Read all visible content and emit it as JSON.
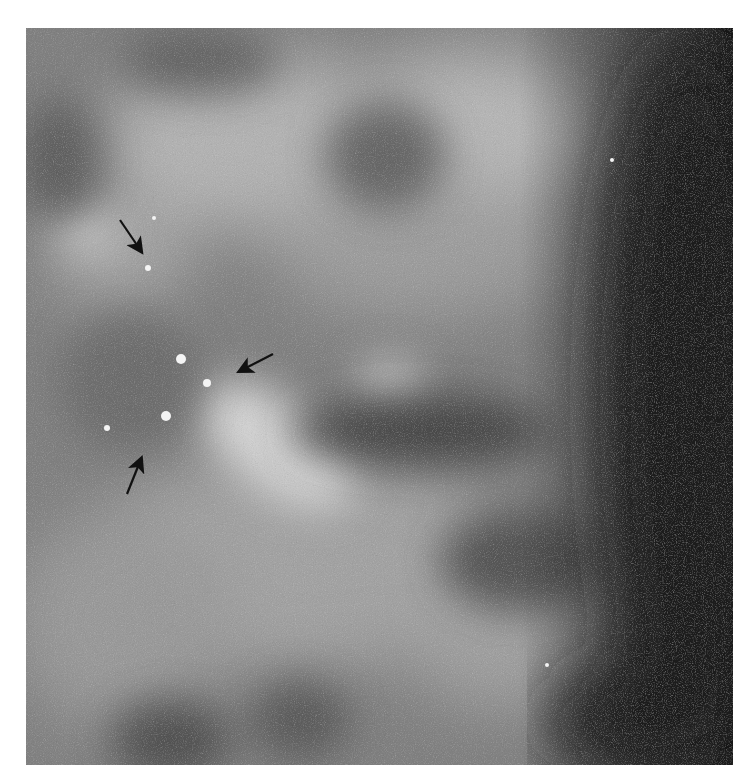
{
  "image": {
    "description": "Grayscale mammogram detail with clustered microcalcifications",
    "frame": {
      "x": 26,
      "y": 28,
      "width": 707,
      "height": 737
    },
    "colors": {
      "tissue_mid": "#7a7a7a",
      "tissue_light": "#c8c8c8",
      "tissue_dark": "#3a3a3a",
      "background_edge": "#1a1a1a",
      "calcification": "#f4f4f4",
      "arrow": "#111111"
    }
  },
  "annotations": {
    "arrows": [
      {
        "name": "arrow-upper",
        "tail": [
          120,
          220
        ],
        "head": [
          143,
          254
        ],
        "direction": "down-right"
      },
      {
        "name": "arrow-middle",
        "tail": [
          273,
          354
        ],
        "head": [
          237,
          373
        ],
        "direction": "down-left"
      },
      {
        "name": "arrow-lower",
        "tail": [
          127,
          494
        ],
        "head": [
          143,
          455
        ],
        "direction": "up-right"
      }
    ],
    "calcifications": [
      {
        "x": 148,
        "y": 268,
        "r": 3
      },
      {
        "x": 181,
        "y": 359,
        "r": 5
      },
      {
        "x": 207,
        "y": 383,
        "r": 4
      },
      {
        "x": 166,
        "y": 416,
        "r": 5
      },
      {
        "x": 107,
        "y": 428,
        "r": 3
      },
      {
        "x": 154,
        "y": 218,
        "r": 2
      },
      {
        "x": 612,
        "y": 160,
        "r": 2
      },
      {
        "x": 547,
        "y": 665,
        "r": 2
      }
    ]
  }
}
